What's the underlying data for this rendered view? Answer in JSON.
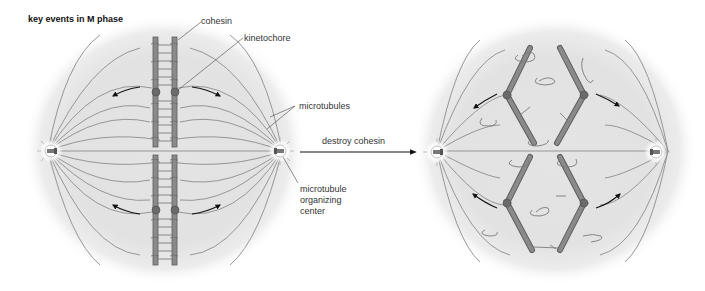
{
  "title": "key events in M phase",
  "labels": {
    "cohesin": "cohesin",
    "kinetochore": "kinetochore",
    "microtubules": "microtubules",
    "mtoc_line1": "microtubule",
    "mtoc_line2": "organizing",
    "mtoc_line3": "center"
  },
  "arrow": {
    "label": "destroy cohesin"
  },
  "panels": [
    {
      "name": "before",
      "description": "sister chromatids held together by cohesin, attached to spindle microtubules at kinetochores"
    },
    {
      "name": "after",
      "description": "cohesin destroyed, sister chromatids pulled apart toward opposite poles"
    }
  ],
  "colors": {
    "cell_fill": "#e6e6e6",
    "chromatid": "#8a8a8a",
    "chromatid_edge": "#5e5e5e",
    "kinetochore": "#6b6b6b",
    "microtubule": "#8c8c8c",
    "arrow": "#111111"
  }
}
